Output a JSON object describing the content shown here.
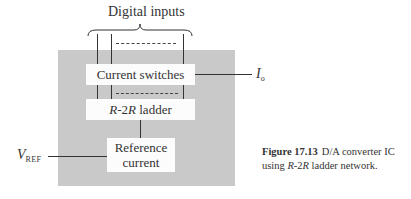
{
  "diagram": {
    "top_label": "Digital inputs",
    "blocks": {
      "current_switches": "Current switches",
      "ladder": {
        "r1": "R",
        "mid": "-2",
        "r2": "R",
        "rest": " ladder"
      },
      "reference_line1": "Reference",
      "reference_line2": "current"
    },
    "output_label": {
      "main": "I",
      "sub": "o"
    },
    "input_label": {
      "main": "V",
      "sub": "REF"
    },
    "colors": {
      "chip_fill": "#c9c9c9",
      "block_fill": "#fcfcfc",
      "line": "#333333"
    }
  },
  "caption": {
    "figure_number": "Figure 17.13",
    "text_part1": "D/A converter IC using ",
    "r1": "R",
    "mid": "-2",
    "r2": "R",
    "text_part2": " ladder network."
  }
}
